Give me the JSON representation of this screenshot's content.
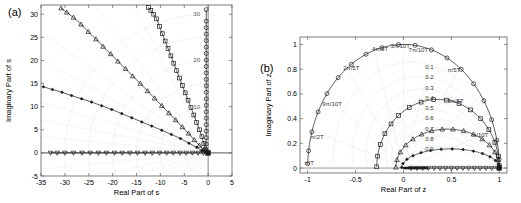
{
  "figure": {
    "width": 521,
    "height": 203,
    "background": "#ffffff",
    "line_color": "#1a1a1a",
    "grid_color": "#c8c8c8",
    "axis_color": "#4d4d4d"
  },
  "panels": [
    {
      "tag": "(a)",
      "name": "s-plane-root-locus",
      "xlabel": "Real Part of s",
      "ylabel": "Imaginary Part of s",
      "xlim": [
        -35,
        5
      ],
      "ylim": [
        -5,
        32
      ],
      "xticks": [
        -35,
        -30,
        -25,
        -20,
        -15,
        -10,
        -5,
        0,
        5
      ],
      "xticklabels": [
        "-35",
        "-30",
        "-25",
        "-20",
        "-15",
        "-10",
        "-5",
        "0",
        "5"
      ],
      "yticks": [
        -5,
        0,
        5,
        10,
        15,
        20,
        25,
        30
      ],
      "yticklabels": [
        "-5",
        "0",
        "5",
        "10",
        "15",
        "20",
        "25",
        "30"
      ],
      "grid_radius_labels": [
        "10",
        "20",
        "30"
      ],
      "grid_radii": [
        5,
        10,
        15,
        20,
        25,
        30
      ],
      "grid_damping_lines": [
        0.1,
        0.2,
        0.3,
        0.4,
        0.5,
        0.6,
        0.7,
        0.8,
        0.9
      ]
    },
    {
      "tag": "(b)",
      "name": "z-plane-root-locus",
      "xlabel": "Real Part of z",
      "ylabel": "Imaginary Part of z",
      "xlim": [
        -1.08,
        1.08
      ],
      "ylim": [
        -0.04,
        1.06
      ],
      "xticks": [
        -1,
        -0.5,
        0,
        0.5,
        1
      ],
      "xticklabels": [
        "-1",
        "-0.5",
        "0",
        "0.5",
        "1"
      ],
      "yticks": [
        0,
        0.2,
        0.4,
        0.6,
        0.8,
        1
      ],
      "yticklabels": [
        "0",
        "0.2",
        "0.4",
        "0.6",
        "0.8",
        "1"
      ],
      "frequency_labels": [
        {
          "text": "π/T",
          "x": -0.985,
          "y": 0.025
        },
        {
          "text": "π/2T",
          "x": -0.9,
          "y": 0.235
        },
        {
          "text": "9π/10T",
          "x": -0.745,
          "y": 0.5
        },
        {
          "text": "2π/5T",
          "x": -0.545,
          "y": 0.795
        },
        {
          "text": "4π/5T",
          "x": -0.245,
          "y": 0.945
        },
        {
          "text": "3π/10T",
          "x": -0.035,
          "y": 0.975
        },
        {
          "text": "7π/10T",
          "x": 0.155,
          "y": 0.935
        },
        {
          "text": "π/5T",
          "x": 0.525,
          "y": 0.775
        },
        {
          "text": "3π/5T",
          "x": 0.545,
          "y": 0.525
        },
        {
          "text": "π/10T",
          "x": 0.8,
          "y": 0.255
        }
      ],
      "damping_labels": [
        "0.1",
        "0.2",
        "0.3",
        "0.4",
        "0.5",
        "0.6",
        "0.7",
        "0.8",
        "0.9"
      ]
    }
  ],
  "chart_data": [
    {
      "type": "scatter",
      "panel": "(a)",
      "title": "",
      "xlabel": "Real Part of s",
      "ylabel": "Imaginary Part of s",
      "xlim": [
        -35,
        5
      ],
      "ylim": [
        -5,
        32
      ],
      "grid": true,
      "legend": "none",
      "series": [
        {
          "name": "branch-circle-vertical",
          "marker": "circle-open",
          "comment": "near-vertical locus along Re(s)=0 rising to Im=31",
          "x": [
            -0.4,
            -0.4,
            -0.4,
            -0.4,
            -0.4,
            -0.4,
            -0.4,
            -0.4,
            -0.4,
            -0.4,
            -0.4,
            -0.4,
            -0.4,
            -0.4,
            -0.4,
            -0.4,
            -0.4,
            -0.4,
            -0.4,
            -0.4,
            -0.4,
            -0.4
          ],
          "y": [
            0.6,
            1.9,
            3.3,
            4.7,
            6.1,
            7.5,
            8.9,
            10.3,
            11.7,
            13.1,
            14.5,
            15.9,
            17.3,
            18.7,
            20.1,
            21.5,
            22.9,
            24.3,
            25.7,
            27.1,
            28.5,
            31.0
          ]
        },
        {
          "name": "branch-square",
          "marker": "square-open",
          "comment": "locus from origin to (-12.5, 31.5)",
          "x": [
            -0.6,
            -0.9,
            -1.3,
            -1.8,
            -2.4,
            -3.0,
            -3.6,
            -4.2,
            -4.8,
            -5.4,
            -6.0,
            -6.6,
            -7.2,
            -7.8,
            -8.4,
            -9.0,
            -9.6,
            -10.2,
            -10.8,
            -11.4,
            -12.0,
            -12.5
          ],
          "y": [
            0.7,
            2.0,
            3.5,
            5.0,
            6.6,
            8.2,
            9.8,
            11.4,
            13.0,
            14.6,
            16.2,
            17.8,
            19.4,
            21.0,
            22.6,
            24.2,
            25.8,
            27.4,
            29.0,
            30.0,
            30.8,
            31.5
          ]
        },
        {
          "name": "branch-triangle",
          "marker": "triangle-open",
          "comment": "locus from origin to (-30.8, 31.3)",
          "x": [
            -1.0,
            -1.8,
            -2.9,
            -4.1,
            -5.4,
            -6.8,
            -8.2,
            -9.7,
            -11.2,
            -12.7,
            -14.2,
            -15.8,
            -17.3,
            -18.9,
            -20.4,
            -22.0,
            -23.5,
            -25.1,
            -26.6,
            -28.2,
            -29.6,
            -30.8
          ],
          "y": [
            0.6,
            1.6,
            2.8,
            4.2,
            5.6,
            7.1,
            8.6,
            10.2,
            11.8,
            13.4,
            15.0,
            16.6,
            18.2,
            19.8,
            21.4,
            23.0,
            24.6,
            26.2,
            27.8,
            29.3,
            30.4,
            31.3
          ]
        },
        {
          "name": "branch-diamond-filled",
          "marker": "diamond-filled",
          "comment": "shallow locus from origin to (-34.5, 14.3)",
          "x": [
            -1.3,
            -2.4,
            -4.0,
            -5.8,
            -7.7,
            -9.7,
            -11.8,
            -13.9,
            -16.0,
            -18.1,
            -20.2,
            -22.3,
            -24.4,
            -26.5,
            -28.6,
            -30.6,
            -32.6,
            -34.5
          ],
          "y": [
            0.5,
            1.2,
            2.1,
            3.1,
            4.0,
            4.9,
            5.8,
            6.7,
            7.6,
            8.5,
            9.4,
            10.2,
            11.0,
            11.7,
            12.4,
            13.1,
            13.7,
            14.3
          ]
        },
        {
          "name": "branch-triangle-down-real-axis",
          "marker": "triangle-down-open",
          "comment": "real-axis locus from origin out to -33",
          "x": [
            -1.0,
            -2.1,
            -3.3,
            -4.6,
            -5.9,
            -7.3,
            -8.7,
            -10.2,
            -11.7,
            -13.2,
            -14.8,
            -16.4,
            -18.0,
            -19.6,
            -21.3,
            -23.0,
            -24.7,
            -26.4,
            -28.2,
            -30.0,
            -31.6,
            -33.0
          ],
          "y": [
            0,
            0,
            0,
            0,
            0,
            0,
            0,
            0,
            0,
            0,
            0,
            0,
            0,
            0,
            0,
            0,
            0,
            0,
            0,
            0,
            0,
            0
          ]
        },
        {
          "name": "open-loop-pole-cluster",
          "marker": "square-filled",
          "comment": "heavy marker cluster at the origin",
          "x": [
            0
          ],
          "y": [
            0
          ]
        }
      ]
    },
    {
      "type": "scatter",
      "panel": "(b)",
      "title": "",
      "xlabel": "Real Part of z",
      "ylabel": "Imaginary Part of z",
      "xlim": [
        -1.08,
        1.08
      ],
      "ylim": [
        -0.04,
        1.06
      ],
      "grid": true,
      "legend": "none",
      "series": [
        {
          "name": "branch-circle-unit-arc",
          "marker": "circle-open",
          "comment": "upper half unit circle from (-1,0) to (1,0)",
          "radius": 1.0,
          "angles_deg": [
            178,
            172,
            163,
            153,
            143,
            133,
            123,
            113,
            103,
            93,
            83,
            73,
            63,
            53,
            43,
            33,
            23,
            13,
            4
          ]
        },
        {
          "name": "branch-square",
          "marker": "square-open",
          "comment": "arc of radius ~0.56 centred near (0.42,0) ending at (1,0)",
          "ellipse": {
            "cx": 0.36,
            "cy": 0.0,
            "rx": 0.64,
            "ry": 0.555
          },
          "angles_deg": [
            179,
            170,
            160,
            150,
            140,
            130,
            118,
            106,
            94,
            82,
            70,
            58,
            46,
            34,
            22,
            10,
            2
          ]
        },
        {
          "name": "branch-triangle",
          "marker": "triangle-open",
          "comment": "arc peaking near Im=0.31 ending at (1,0)",
          "ellipse": {
            "cx": 0.46,
            "cy": 0.0,
            "rx": 0.54,
            "ry": 0.315
          },
          "angles_deg": [
            179,
            168,
            156,
            144,
            132,
            120,
            108,
            96,
            84,
            72,
            60,
            48,
            36,
            24,
            12,
            3
          ]
        },
        {
          "name": "branch-diamond-filled",
          "marker": "diamond-filled",
          "comment": "flat arc peaking near Im=0.155 ending at (1,0)",
          "ellipse": {
            "cx": 0.49,
            "cy": 0.0,
            "rx": 0.51,
            "ry": 0.155
          },
          "angles_deg": [
            178,
            166,
            153,
            140,
            127,
            114,
            101,
            88,
            75,
            62,
            49,
            36,
            23,
            10,
            2
          ]
        },
        {
          "name": "branch-triangle-down-real-axis",
          "marker": "triangle-down-open",
          "comment": "real-axis locus from ~0.05 out to 1.0",
          "x": [
            0.08,
            0.14,
            0.2,
            0.26,
            0.32,
            0.38,
            0.44,
            0.5,
            0.56,
            0.62,
            0.68,
            0.74,
            0.8,
            0.86,
            0.92,
            0.98
          ],
          "y": [
            0,
            0,
            0,
            0,
            0,
            0,
            0,
            0,
            0,
            0,
            0,
            0,
            0,
            0,
            0,
            0
          ]
        },
        {
          "name": "origin-pole-cluster",
          "marker": "cross-dense",
          "comment": "dense marker cluster just right of z=0",
          "x": [
            0.02
          ],
          "y": [
            0
          ]
        }
      ]
    }
  ]
}
